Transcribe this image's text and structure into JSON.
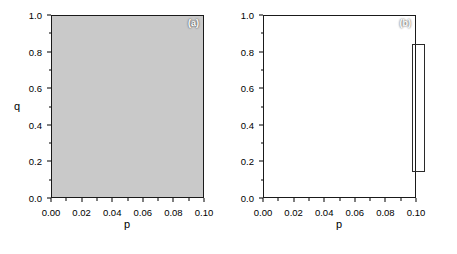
{
  "chart_data": {
    "type": "heatmap",
    "title": "",
    "subtitle": "",
    "layout": "two side-by-side filled contour panels sharing one grayscale colorbar",
    "xlabel": "p",
    "ylabel": "q",
    "xlim": [
      0.0,
      0.1
    ],
    "ylim": [
      0.0,
      1.0
    ],
    "xticks": [
      "0.00",
      "0.02",
      "0.04",
      "0.06",
      "0.08",
      "0.10"
    ],
    "xtick_values": [
      0.0,
      0.02,
      0.04,
      0.06,
      0.08,
      0.1
    ],
    "yticks": [
      "0.0",
      "0.2",
      "0.4",
      "0.6",
      "0.8",
      "1.0"
    ],
    "ytick_values": [
      0.0,
      0.2,
      0.4,
      0.6,
      0.8,
      1.0
    ],
    "grid": false,
    "legend_position": "right",
    "colorbar": {
      "orientation": "vertical",
      "min": 0,
      "max": 112,
      "step": 14,
      "ticks": [
        "0",
        "14",
        "28",
        "42",
        "56",
        "70",
        "84",
        "98",
        "112"
      ],
      "tick_values": [
        0,
        14,
        28,
        42,
        56,
        70,
        84,
        98,
        112
      ],
      "colors": [
        "#0b0b0b",
        "#1f1f1f",
        "#333333",
        "#474747",
        "#5c5c5c",
        "#707070",
        "#878787",
        "#9e9e9e",
        "#b5b5b5",
        "#c9c9c9"
      ],
      "low_color": "#0b0b0b",
      "high_color": "#c9c9c9",
      "note": "discrete stepped grayscale, black = 0 at top, light gray = 112 at bottom"
    },
    "panels": [
      {
        "tag": "(a)",
        "tag_color": "#ffffff",
        "description": "Minimum (black) valley is a horizontal band centred near q = 0.50 spanning most of p; contours rise steeply near p < 0.01 and flatten for p > 0.03. Values increase toward q = 1.0 (many closely spaced light bands) and more gradually toward q = 0.0.",
        "minimum_band_q": [
          0.44,
          0.55
        ],
        "levels": [
          0,
          14,
          28,
          42,
          56,
          70,
          84,
          98,
          112
        ],
        "contours": [
          {
            "level": 14,
            "points": [
              [
                0.0,
                0.655
              ],
              [
                0.004,
                0.64
              ],
              [
                0.008,
                0.59
              ],
              [
                0.012,
                0.565
              ],
              [
                0.02,
                0.56
              ],
              [
                0.04,
                0.558
              ],
              [
                0.06,
                0.556
              ],
              [
                0.08,
                0.554
              ],
              [
                0.1,
                0.552
              ]
            ]
          },
          {
            "level": 14,
            "points": [
              [
                0.0,
                0.33
              ],
              [
                0.004,
                0.36
              ],
              [
                0.008,
                0.4
              ],
              [
                0.013,
                0.425
              ],
              [
                0.02,
                0.435
              ],
              [
                0.04,
                0.44
              ],
              [
                0.06,
                0.442
              ],
              [
                0.08,
                0.443
              ],
              [
                0.1,
                0.444
              ]
            ]
          },
          {
            "level": 28,
            "points": [
              [
                0.0,
                0.69
              ],
              [
                0.005,
                0.68
              ],
              [
                0.01,
                0.645
              ],
              [
                0.016,
                0.628
              ],
              [
                0.025,
                0.622
              ],
              [
                0.045,
                0.62
              ],
              [
                0.07,
                0.618
              ],
              [
                0.1,
                0.617
              ]
            ]
          },
          {
            "level": 28,
            "points": [
              [
                0.0,
                0.3
              ],
              [
                0.006,
                0.312
              ],
              [
                0.012,
                0.33
              ],
              [
                0.02,
                0.338
              ],
              [
                0.04,
                0.342
              ],
              [
                0.07,
                0.345
              ],
              [
                0.1,
                0.347
              ]
            ]
          },
          {
            "level": 42,
            "points": [
              [
                0.0,
                0.745
              ],
              [
                0.006,
                0.735
              ],
              [
                0.012,
                0.705
              ],
              [
                0.02,
                0.69
              ],
              [
                0.032,
                0.682
              ],
              [
                0.055,
                0.678
              ],
              [
                0.08,
                0.676
              ],
              [
                0.1,
                0.675
              ]
            ]
          },
          {
            "level": 42,
            "points": [
              [
                0.0,
                0.2
              ],
              [
                0.008,
                0.21
              ],
              [
                0.016,
                0.222
              ],
              [
                0.03,
                0.228
              ],
              [
                0.06,
                0.232
              ],
              [
                0.1,
                0.235
              ]
            ]
          },
          {
            "level": 56,
            "points": [
              [
                0.0,
                0.8
              ],
              [
                0.007,
                0.79
              ],
              [
                0.014,
                0.762
              ],
              [
                0.024,
                0.745
              ],
              [
                0.036,
                0.738
              ],
              [
                0.06,
                0.734
              ],
              [
                0.1,
                0.731
              ]
            ]
          },
          {
            "level": 56,
            "points": [
              [
                0.0,
                0.105
              ],
              [
                0.01,
                0.118
              ],
              [
                0.022,
                0.13
              ],
              [
                0.045,
                0.136
              ],
              [
                0.075,
                0.14
              ],
              [
                0.1,
                0.142
              ]
            ]
          },
          {
            "level": 70,
            "points": [
              [
                0.0,
                0.85
              ],
              [
                0.008,
                0.842
              ],
              [
                0.016,
                0.818
              ],
              [
                0.028,
                0.8
              ],
              [
                0.042,
                0.793
              ],
              [
                0.07,
                0.789
              ],
              [
                0.1,
                0.787
              ]
            ]
          },
          {
            "level": 70,
            "points": [
              [
                0.0,
                0.01
              ],
              [
                0.012,
                0.03
              ],
              [
                0.028,
                0.046
              ],
              [
                0.055,
                0.054
              ],
              [
                0.085,
                0.058
              ],
              [
                0.1,
                0.06
              ]
            ]
          },
          {
            "level": 84,
            "points": [
              [
                0.0,
                0.9
              ],
              [
                0.01,
                0.892
              ],
              [
                0.02,
                0.868
              ],
              [
                0.032,
                0.85
              ],
              [
                0.048,
                0.843
              ],
              [
                0.075,
                0.84
              ],
              [
                0.1,
                0.838
              ]
            ]
          },
          {
            "level": 98,
            "points": [
              [
                0.0,
                0.948
              ],
              [
                0.012,
                0.94
              ],
              [
                0.024,
                0.918
              ],
              [
                0.036,
                0.905
              ],
              [
                0.04,
                0.912
              ],
              [
                0.046,
                0.898
              ],
              [
                0.06,
                0.893
              ],
              [
                0.08,
                0.89
              ],
              [
                0.1,
                0.888
              ]
            ]
          },
          {
            "level": 112,
            "points": [
              [
                0.0,
                0.985
              ],
              [
                0.014,
                0.978
              ],
              [
                0.028,
                0.958
              ],
              [
                0.044,
                0.946
              ],
              [
                0.07,
                0.941
              ],
              [
                0.1,
                0.938
              ]
            ]
          }
        ]
      },
      {
        "tag": "(b)",
        "tag_color": "#ffffff",
        "description": "Broad black minimum lobe centred near q = 0.45-0.55 that widens smoothly with p; contours form large arcs opening to the right. Fewer, wider bands than panel (a), values rise toward q = 1.0 and q = 0.0.",
        "minimum_band_q": [
          0.38,
          0.58
        ],
        "levels": [
          0,
          14,
          28,
          42,
          56,
          70,
          84,
          98,
          112
        ],
        "contours": [
          {
            "level": 14,
            "points": [
              [
                0.002,
                0.76
              ],
              [
                0.006,
                0.8
              ],
              [
                0.01,
                0.78
              ],
              [
                0.014,
                0.72
              ],
              [
                0.022,
                0.66
              ],
              [
                0.04,
                0.62
              ],
              [
                0.065,
                0.6
              ],
              [
                0.1,
                0.59
              ]
            ]
          },
          {
            "level": 14,
            "points": [
              [
                0.002,
                0.3
              ],
              [
                0.008,
                0.33
              ],
              [
                0.016,
                0.37
              ],
              [
                0.03,
                0.395
              ],
              [
                0.055,
                0.405
              ],
              [
                0.08,
                0.408
              ],
              [
                0.1,
                0.41
              ]
            ]
          },
          {
            "level": 28,
            "points": [
              [
                0.002,
                0.88
              ],
              [
                0.008,
                0.9
              ],
              [
                0.014,
                0.87
              ],
              [
                0.024,
                0.795
              ],
              [
                0.04,
                0.73
              ],
              [
                0.065,
                0.7
              ],
              [
                0.1,
                0.688
              ]
            ]
          },
          {
            "level": 28,
            "points": [
              [
                0.002,
                0.25
              ],
              [
                0.01,
                0.278
              ],
              [
                0.022,
                0.3
              ],
              [
                0.045,
                0.312
              ],
              [
                0.075,
                0.318
              ],
              [
                0.1,
                0.32
              ]
            ]
          },
          {
            "level": 42,
            "points": [
              [
                0.003,
                0.96
              ],
              [
                0.01,
                0.975
              ],
              [
                0.018,
                0.945
              ],
              [
                0.03,
                0.875
              ],
              [
                0.048,
                0.81
              ],
              [
                0.072,
                0.78
              ],
              [
                0.1,
                0.768
              ]
            ]
          },
          {
            "level": 42,
            "points": [
              [
                0.002,
                0.175
              ],
              [
                0.012,
                0.195
              ],
              [
                0.026,
                0.212
              ],
              [
                0.05,
                0.222
              ],
              [
                0.08,
                0.226
              ],
              [
                0.1,
                0.228
              ]
            ]
          },
          {
            "level": 56,
            "points": [
              [
                0.006,
                1.0
              ],
              [
                0.016,
                0.998
              ],
              [
                0.028,
                0.962
              ],
              [
                0.042,
                0.905
              ],
              [
                0.062,
                0.872
              ],
              [
                0.085,
                0.86
              ],
              [
                0.1,
                0.856
              ]
            ]
          },
          {
            "level": 56,
            "points": [
              [
                0.002,
                0.09
              ],
              [
                0.014,
                0.112
              ],
              [
                0.032,
                0.128
              ],
              [
                0.06,
                0.136
              ],
              [
                0.09,
                0.14
              ],
              [
                0.1,
                0.141
              ]
            ]
          },
          {
            "level": 70,
            "points": [
              [
                0.02,
                1.0
              ],
              [
                0.034,
                0.995
              ],
              [
                0.05,
                0.965
              ],
              [
                0.07,
                0.945
              ],
              [
                0.1,
                0.935
              ]
            ]
          },
          {
            "level": 70,
            "points": [
              [
                0.003,
                0.005
              ],
              [
                0.018,
                0.03
              ],
              [
                0.04,
                0.048
              ],
              [
                0.07,
                0.058
              ],
              [
                0.1,
                0.062
              ]
            ]
          },
          {
            "level": 84,
            "points": [
              [
                0.048,
                1.0
              ],
              [
                0.065,
                0.995
              ],
              [
                0.085,
                0.985
              ],
              [
                0.1,
                0.982
              ]
            ]
          }
        ]
      }
    ]
  },
  "panel_a": {
    "tag": "(a)",
    "xlabel": "p",
    "ylabel": "q"
  },
  "panel_b": {
    "tag": "(b)",
    "xlabel": "p",
    "ylabel": "q"
  },
  "colorbar_labels": [
    "0",
    "14",
    "28",
    "42",
    "56",
    "70",
    "84",
    "98",
    "112"
  ]
}
